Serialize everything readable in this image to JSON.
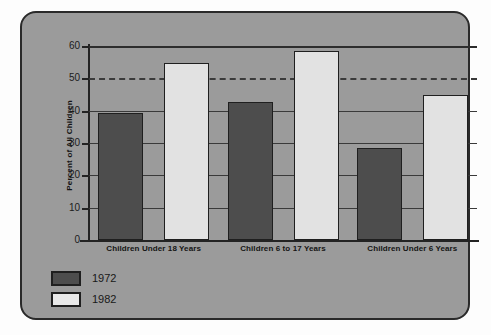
{
  "chart_data": {
    "type": "bar",
    "title": "",
    "xlabel": "",
    "ylabel": "Percent of All Children",
    "ylim": [
      0,
      60
    ],
    "yticks": [
      0,
      10,
      20,
      30,
      40,
      50,
      60
    ],
    "ytick_labels": [
      "0",
      "10",
      "20",
      "30",
      "40",
      "50",
      "60"
    ],
    "grid": "horizontal",
    "gridline_styles": {
      "10": "solid-behind-bars",
      "20": "solid-behind-bars",
      "30": "solid-behind-bars",
      "40": "solid-behind-bars",
      "50": "dashed-full-width",
      "60": "solid-full-width"
    },
    "legend_position": "bottom-left",
    "categories": [
      "Children Under 18 Years",
      "Children 6 to 17 Years",
      "Children Under 6 Years"
    ],
    "series": [
      {
        "name": "1972",
        "color": "#4d4d4d",
        "values": [
          39.4,
          42.6,
          28.6
        ]
      },
      {
        "name": "1982",
        "color": "#e2e2e2",
        "values": [
          54.6,
          58.6,
          44.8
        ]
      }
    ]
  },
  "legend": {
    "items": [
      {
        "label": "1972",
        "swatch": "dark-gray-swatch"
      },
      {
        "label": "1982",
        "swatch": "light-gray-swatch"
      }
    ]
  },
  "colors": {
    "panel_background": "#9b9b9b",
    "panel_border": "#2a2a2a",
    "page_background": "#fdfdfd",
    "axis": "#232323",
    "gridline": "#3a3a3a",
    "series_1972": "#4d4d4d",
    "series_1982": "#e2e2e2",
    "text": "#141414"
  }
}
